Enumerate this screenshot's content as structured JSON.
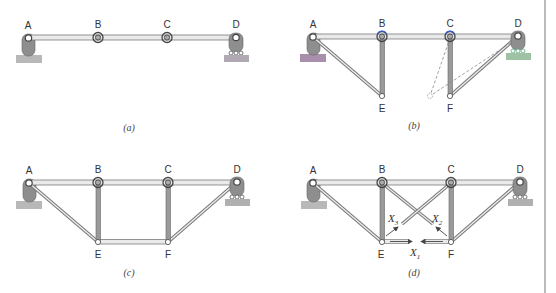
{
  "figure": {
    "panels": [
      {
        "id": "a",
        "caption": "(a)",
        "nodes": {
          "A": "A",
          "B": "B",
          "C": "C",
          "D": "D"
        },
        "description": "Continuous beam A-B-C-D with pin support at A, roller at D, rotational springs at B and C"
      },
      {
        "id": "b",
        "caption": "(b)",
        "nodes": {
          "A": "A",
          "B": "B",
          "C": "C",
          "D": "D",
          "E": "E",
          "F": "F"
        },
        "description": "Beam with members A-E, B-E, C-F, D-F added; dashed alternate position of F"
      },
      {
        "id": "c",
        "caption": "(c)",
        "nodes": {
          "A": "A",
          "B": "B",
          "C": "C",
          "D": "D",
          "E": "E",
          "F": "F"
        },
        "description": "Truss with bottom chord E-F added"
      },
      {
        "id": "d",
        "caption": "(d)",
        "nodes": {
          "A": "A",
          "B": "B",
          "C": "C",
          "D": "D",
          "E": "E",
          "F": "F"
        },
        "redundants": {
          "x1": {
            "base": "X",
            "sub": "1"
          },
          "x2": {
            "base": "X",
            "sub": "2"
          },
          "x3": {
            "base": "X",
            "sub": "3"
          }
        },
        "description": "Truss with diagonals B-F and C-E, redundant forces X1, X2, X3 shown with arrows"
      }
    ],
    "colors": {
      "member": "#9a9a9a",
      "member_dark": "#6e6e6e",
      "support": "#8c8c8c",
      "ground": "#b4b4b4",
      "ground_accent_b_left": "#9b6fa0",
      "ground_accent_b_right": "#8fb596",
      "spring_accent": "#3a5ccc",
      "label_accent": "#d8c94a"
    }
  }
}
